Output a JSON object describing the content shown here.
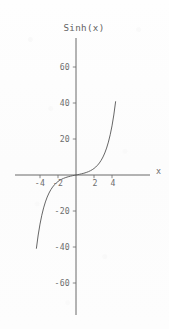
{
  "figure": {
    "title": "Sinh(x)",
    "background_color": "#fdfdfd",
    "ink_color": "#5a5a5a",
    "text_color": "#6d6d6d",
    "width_px": 169,
    "height_px": 329
  },
  "axes": {
    "x_axis_label": "x",
    "y_axis_label": "",
    "origin_px": {
      "x": 76,
      "y": 175
    },
    "x_tick_labels": [
      "-4",
      "-2",
      "2",
      "4"
    ],
    "y_tick_labels": [
      "60",
      "40",
      "20",
      "-20",
      "-40",
      "-60"
    ]
  },
  "chart_data": {
    "type": "line",
    "title": "Sinh(x)",
    "subtitle": "",
    "xlabel": "x",
    "ylabel": "",
    "grid": false,
    "legend": null,
    "legend_position": "none",
    "axis_style": "centered-cross",
    "xlim": [
      -4.8,
      4.8
    ],
    "ylim": [
      -75,
      75
    ],
    "xticks": [
      -4,
      -2,
      2,
      4
    ],
    "xtick_labels": [
      "-4",
      "-2",
      "2",
      "4"
    ],
    "yticks": [
      60,
      40,
      20,
      -20,
      -40,
      -60
    ],
    "ytick_labels": [
      "60",
      "40",
      "20",
      "-20",
      "-40",
      "-60"
    ],
    "series": [
      {
        "name": "Sinh(x)",
        "function": "sinh(x)",
        "color": "#5e5e5e",
        "x": [
          -4.4,
          -4.2,
          -4.0,
          -3.8,
          -3.6,
          -3.4,
          -3.2,
          -3.0,
          -2.8,
          -2.6,
          -2.4,
          -2.2,
          -2.0,
          -1.8,
          -1.6,
          -1.4,
          -1.2,
          -1.0,
          -0.8,
          -0.6,
          -0.4,
          -0.2,
          0.0,
          0.2,
          0.4,
          0.6,
          0.8,
          1.0,
          1.2,
          1.4,
          1.6,
          1.8,
          2.0,
          2.2,
          2.4,
          2.6,
          2.8,
          3.0,
          3.2,
          3.4,
          3.6,
          3.8,
          4.0,
          4.2,
          4.4
        ],
        "y": [
          -40.72,
          -33.34,
          -27.29,
          -22.34,
          -18.29,
          -14.97,
          -12.25,
          -10.02,
          -8.19,
          -6.69,
          -5.47,
          -4.46,
          -3.63,
          -2.94,
          -2.38,
          -1.9,
          -1.51,
          -1.18,
          -0.89,
          -0.64,
          -0.41,
          -0.2,
          0.0,
          0.2,
          0.41,
          0.64,
          0.89,
          1.18,
          1.51,
          1.9,
          2.38,
          2.94,
          3.63,
          4.46,
          5.47,
          6.69,
          8.19,
          10.02,
          12.25,
          14.97,
          18.29,
          22.34,
          27.29,
          33.34,
          40.72
        ]
      }
    ],
    "annotations": []
  }
}
